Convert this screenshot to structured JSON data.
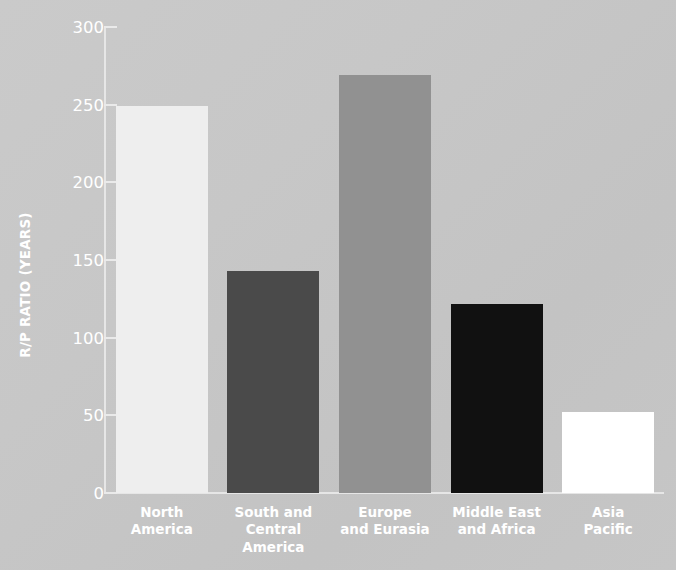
{
  "chart_data": {
    "type": "bar",
    "title": "",
    "xlabel": "",
    "ylabel": "R/P RATIO (YEARS)",
    "ylim": [
      0,
      300
    ],
    "yticks": [
      0,
      50,
      100,
      150,
      200,
      250,
      300
    ],
    "grid": false,
    "legend": "none",
    "categories": [
      "North\nAmerica",
      "South and\nCentral\nAmerica",
      "Europe\nand Eurasia",
      "Middle East\nand Africa",
      "Asia\nPacific"
    ],
    "values": [
      249,
      143,
      269,
      122,
      52
    ],
    "bar_colors": [
      "#eeeeee",
      "#4a4a4a",
      "#919191",
      "#111111",
      "#ffffff"
    ]
  },
  "axis": {
    "y_title": "R/P RATIO (YEARS)",
    "tick_labels": [
      "300",
      "250",
      "200",
      "150",
      "100",
      "50",
      "0"
    ]
  },
  "colors": {
    "text": "#ffffff",
    "axis": "#e6e6e6",
    "background": "#c7c7c7"
  }
}
